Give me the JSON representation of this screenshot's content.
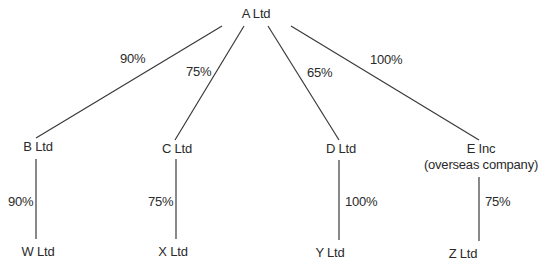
{
  "diagram": {
    "type": "group-structure",
    "nodes": {
      "a": {
        "label": "A Ltd"
      },
      "b": {
        "label": "B Ltd"
      },
      "c": {
        "label": "C Ltd"
      },
      "d": {
        "label": "D Ltd"
      },
      "e": {
        "label": "E Inc",
        "sublabel": "(overseas company)"
      },
      "w": {
        "label": "W Ltd"
      },
      "x": {
        "label": "X Ltd"
      },
      "y": {
        "label": "Y Ltd"
      },
      "z": {
        "label": "Z Ltd"
      }
    },
    "edges": {
      "a_b": {
        "from": "A Ltd",
        "to": "B Ltd",
        "pct": "90%"
      },
      "a_c": {
        "from": "A Ltd",
        "to": "C Ltd",
        "pct": "75%"
      },
      "a_d": {
        "from": "A Ltd",
        "to": "D Ltd",
        "pct": "65%"
      },
      "a_e": {
        "from": "A Ltd",
        "to": "E Inc",
        "pct": "100%"
      },
      "b_w": {
        "from": "B Ltd",
        "to": "W Ltd",
        "pct": "90%"
      },
      "c_x": {
        "from": "C Ltd",
        "to": "X Ltd",
        "pct": "75%"
      },
      "d_y": {
        "from": "D Ltd",
        "to": "Y Ltd",
        "pct": "100%"
      },
      "e_z": {
        "from": "E Inc",
        "to": "Z Ltd",
        "pct": "75%"
      }
    }
  }
}
